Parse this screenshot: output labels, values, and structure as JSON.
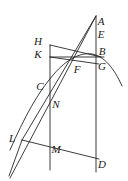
{
  "figure": {
    "width": 128,
    "height": 181,
    "background_color": "#ffffff",
    "stroke_color": "#262626",
    "stroke_width": 0.9,
    "labels": [
      {
        "id": "A",
        "text": "A",
        "x": 101,
        "y": 21
      },
      {
        "id": "E",
        "text": "E",
        "x": 101,
        "y": 34
      },
      {
        "id": "B",
        "text": "B",
        "x": 102,
        "y": 51
      },
      {
        "id": "G",
        "text": "G",
        "x": 102,
        "y": 66
      },
      {
        "id": "H",
        "text": "H",
        "x": 38,
        "y": 41
      },
      {
        "id": "K",
        "text": "K",
        "x": 38,
        "y": 54
      },
      {
        "id": "C",
        "text": "C",
        "x": 40,
        "y": 86
      },
      {
        "id": "F",
        "text": "F",
        "x": 77,
        "y": 69
      },
      {
        "id": "N",
        "text": "N",
        "x": 56,
        "y": 104
      },
      {
        "id": "L",
        "text": "L",
        "x": 12,
        "y": 138
      },
      {
        "id": "M",
        "text": "M",
        "x": 56,
        "y": 149
      },
      {
        "id": "D",
        "text": "D",
        "x": 102,
        "y": 164
      }
    ],
    "segments": [
      {
        "id": "left-vertical-HM",
        "name": "vertical line through H K C N M",
        "x1": 50,
        "y1": 45,
        "x2": 50,
        "y2": 170
      },
      {
        "id": "right-vertical-AD",
        "name": "vertical line through A E B G D",
        "x1": 96,
        "y1": 16,
        "x2": 96,
        "y2": 172
      },
      {
        "id": "apex-to-L",
        "name": "line from apex A down through F C to L",
        "x1": 96,
        "y1": 16,
        "x2": 22,
        "y2": 140
      },
      {
        "id": "apex-to-lower-left",
        "name": "line from apex through N down past L",
        "x1": 96,
        "y1": 16,
        "x2": 10,
        "y2": 178
      },
      {
        "id": "H-to-B",
        "name": "segment H to B",
        "x1": 50,
        "y1": 45,
        "x2": 101,
        "y2": 57
      },
      {
        "id": "K-to-B",
        "name": "segment K to B region",
        "x1": 50,
        "y1": 57,
        "x2": 104,
        "y2": 57
      },
      {
        "id": "K-to-G",
        "name": "segment K to G",
        "x1": 50,
        "y1": 57,
        "x2": 99,
        "y2": 64
      },
      {
        "id": "L-to-D",
        "name": "segment L to D",
        "x1": 22,
        "y1": 140,
        "x2": 99,
        "y2": 159
      },
      {
        "id": "oblique-lower-tail",
        "name": "lower tail of oblique line below L",
        "x1": 22,
        "y1": 140,
        "x2": 9,
        "y2": 176
      }
    ],
    "curves": [
      {
        "id": "arc-through-C-G",
        "name": "curved arc through C F G descending right",
        "path": "M 10 150 C 24 118 38 92 54 74 C 66 60 80 52 92 54 C 104 56 114 68 122 86"
      }
    ]
  }
}
